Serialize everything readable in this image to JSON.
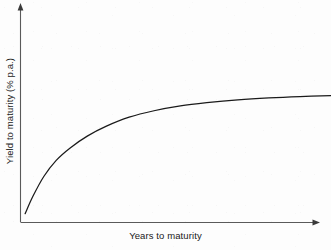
{
  "chart_data": {
    "type": "line",
    "title": "",
    "subtitle": "",
    "xlabel": "Years to maturity",
    "ylabel": "Yield to maturity (% p.a.)",
    "grid": false,
    "legend": null,
    "axes": {
      "x_ticks": [],
      "y_ticks": [],
      "x_arrow": true,
      "y_arrow": true,
      "xlim": [
        0,
        20
      ],
      "ylim": [
        0,
        10
      ]
    },
    "annotations": [],
    "series": [
      {
        "name": "Normal (upward-sloping) yield curve",
        "color": "#1a1a1a",
        "x": [
          0.3,
          0.8,
          1.5,
          2.3,
          3.2,
          4.3,
          5.5,
          7.0,
          8.6,
          10.3,
          12.0,
          14.0,
          16.0,
          18.0,
          20.0
        ],
        "y": [
          0.55,
          1.62,
          2.85,
          3.85,
          4.62,
          5.35,
          5.95,
          6.52,
          6.92,
          7.22,
          7.42,
          7.6,
          7.72,
          7.8,
          7.85
        ]
      }
    ]
  },
  "figure": {
    "x_axis_label": "Years to maturity",
    "y_axis_label": "Yield to maturity (% p.a.)",
    "line_color": "#1a1a1a",
    "axis_color": "#555555",
    "background_color": "#fdfdfd"
  }
}
